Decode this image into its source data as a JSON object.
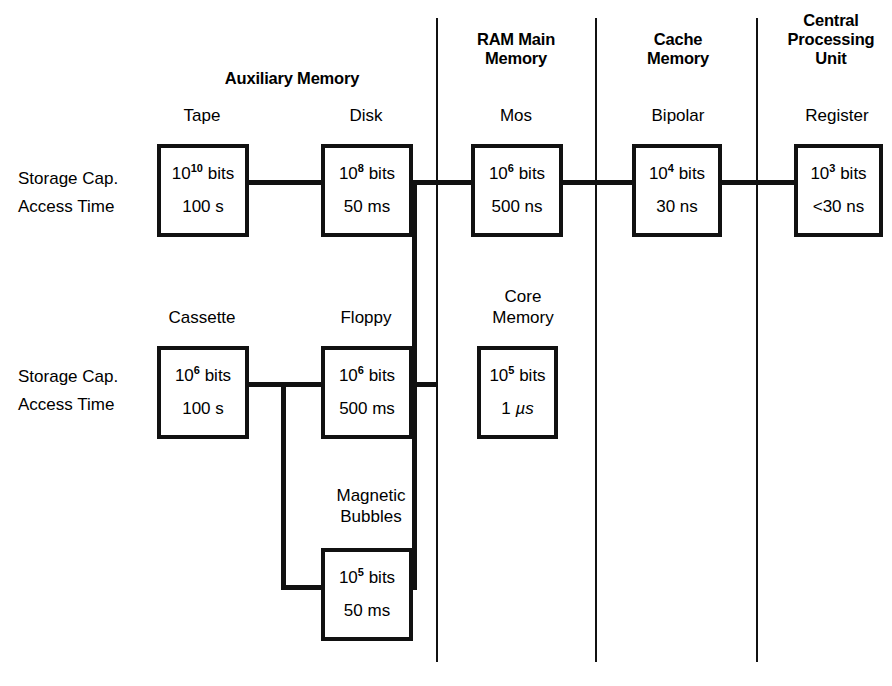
{
  "diagram": {
    "row_labels": [
      {
        "storage": "Storage Cap.",
        "access": "Access Time"
      },
      {
        "storage": "Storage Cap.",
        "access": "Access Time"
      }
    ],
    "group_headings": [
      {
        "id": "auxiliary-memory",
        "label": "Auxiliary Memory"
      },
      {
        "id": "ram-main-memory",
        "label": "RAM Main\nMemory"
      },
      {
        "id": "cache-memory",
        "label": "Cache\nMemory"
      },
      {
        "id": "central-processing-unit",
        "label": "Central\nProcessing\nUnit"
      }
    ],
    "nodes": [
      {
        "id": "tape",
        "caption": "Tape",
        "capacity_base": "10",
        "capacity_exp": "10",
        "capacity_unit": "bits",
        "access_time": "100 s"
      },
      {
        "id": "disk",
        "caption": "Disk",
        "capacity_base": "10",
        "capacity_exp": "8",
        "capacity_unit": "bits",
        "access_time": "50 ms"
      },
      {
        "id": "mos",
        "caption": "Mos",
        "capacity_base": "10",
        "capacity_exp": "6",
        "capacity_unit": "bits",
        "access_time": "500 ns"
      },
      {
        "id": "bipolar",
        "caption": "Bipolar",
        "capacity_base": "10",
        "capacity_exp": "4",
        "capacity_unit": "bits",
        "access_time": "30 ns"
      },
      {
        "id": "register",
        "caption": "Register",
        "capacity_base": "10",
        "capacity_exp": "3",
        "capacity_unit": "bits",
        "access_time": "<30 ns"
      },
      {
        "id": "cassette",
        "caption": "Cassette",
        "capacity_base": "10",
        "capacity_exp": "6",
        "capacity_unit": "bits",
        "access_time": "100 s"
      },
      {
        "id": "floppy",
        "caption": "Floppy",
        "capacity_base": "10",
        "capacity_exp": "6",
        "capacity_unit": "bits",
        "access_time": "500 ms"
      },
      {
        "id": "core-memory",
        "caption": "Core\nMemory",
        "capacity_base": "10",
        "capacity_exp": "5",
        "capacity_unit": "bits",
        "access_time_value": "1 ",
        "access_time_unit": "µs"
      },
      {
        "id": "magnetic-bubbles",
        "caption": "Magnetic\nBubbles",
        "capacity_base": "10",
        "capacity_exp": "5",
        "capacity_unit": "bits",
        "access_time": "50 ms"
      }
    ],
    "colors": {
      "ink": "#111111",
      "background": "#ffffff"
    }
  }
}
